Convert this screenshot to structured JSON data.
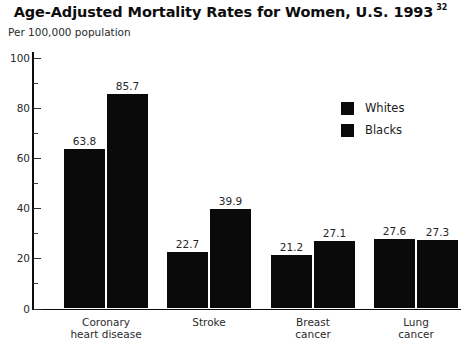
{
  "chart_data": {
    "type": "bar",
    "title": "Age-Adjusted Mortality Rates for Women, U.S. 1993",
    "title_superscript": "32",
    "subtitle": "Per 100,000 population",
    "xlabel": "",
    "ylabel": "Per 100,000 population",
    "ylim": [
      0,
      100
    ],
    "ytick_labels": [
      "0",
      "20",
      "40",
      "60",
      "80",
      "100"
    ],
    "ytick_values": [
      0,
      20,
      40,
      60,
      80,
      100
    ],
    "yminor_values": [
      10,
      30,
      50,
      70,
      90
    ],
    "grid": false,
    "legend_position": "upper right",
    "categories": [
      "Coronary\nheart disease",
      "Stroke",
      "Breast\ncancer",
      "Lung\ncancer"
    ],
    "series": [
      {
        "name": "Whites",
        "color": "#0a0a0a",
        "values": [
          63.8,
          22.7,
          21.2,
          27.6
        ]
      },
      {
        "name": "Blacks",
        "color": "#0a0a0a",
        "values": [
          85.7,
          39.9,
          27.1,
          27.3
        ]
      }
    ],
    "value_labels": [
      [
        "63.8",
        "85.7"
      ],
      [
        "22.7",
        "39.9"
      ],
      [
        "21.2",
        "27.1"
      ],
      [
        "27.6",
        "27.3"
      ]
    ]
  },
  "legend": {
    "items": [
      {
        "label": "Whites",
        "swatch": "black-square-swatch"
      },
      {
        "label": "Blacks",
        "swatch": "black-square-swatch"
      }
    ]
  }
}
